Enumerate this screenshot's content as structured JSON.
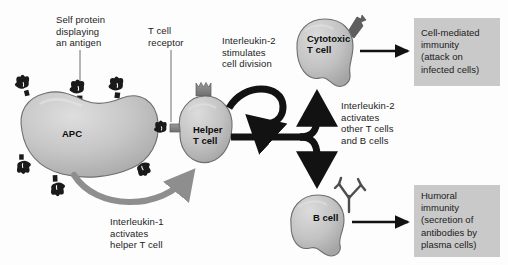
{
  "figure": {
    "background_color": "#fdfdfd"
  },
  "palette": {
    "cell_fill": "#c2c2c2",
    "cell_fill_light": "#d6d6d6",
    "cell_stroke": "#6e6e6e",
    "receptor_dark": "#1a1a1a",
    "receptor_gray": "#8a8a8a",
    "arrow_black": "#121212",
    "arrow_gray": "#8e8e8e",
    "box_fill": "#c9c9c9",
    "text_color": "#1c1c1c"
  },
  "cells": [
    {
      "id": "apc",
      "label": "APC",
      "label_x": 62,
      "label_y": 128
    },
    {
      "id": "helper-t-cell",
      "label": "Helper\nT cell",
      "label_x": 193,
      "label_y": 124
    },
    {
      "id": "cytotoxic-t-cell",
      "label": "Cytotoxic\nT cell",
      "label_x": 307,
      "label_y": 33
    },
    {
      "id": "b-cell",
      "label": "B cell",
      "label_x": 313,
      "label_y": 212
    }
  ],
  "annotations": [
    {
      "id": "self-protein",
      "text": "Self protein\ndisplaying\nan antigen",
      "x": 56,
      "y": 14,
      "leader": true
    },
    {
      "id": "t-cell-receptor",
      "text": "T cell\nreceptor",
      "x": 148,
      "y": 25,
      "leader": true
    },
    {
      "id": "interleukin-2-division",
      "text": "Interleukin-2\nstimulates\ncell division",
      "x": 222,
      "y": 35,
      "leader": false
    },
    {
      "id": "interleukin-2-activates",
      "text": "Interleukin-2\nactivates\nother T cells\nand B cells",
      "x": 341,
      "y": 100,
      "leader": false
    },
    {
      "id": "interleukin-1-activates",
      "text": "Interleukin-1\nactivates\nhelper T cell",
      "x": 110,
      "y": 216,
      "leader": false
    }
  ],
  "outcomes": [
    {
      "id": "cell-mediated-immunity",
      "text": "Cell-mediated\nimmunity\n(attack on\ninfected cells)",
      "box": {
        "x": 414,
        "y": 18,
        "w": 86,
        "h": 68
      },
      "text_x": 421,
      "text_y": 27
    },
    {
      "id": "humoral-immunity",
      "text": "Humoral\nimmunity\n(secretion of\nantibodies by\nplasma cells)",
      "box": {
        "x": 414,
        "y": 185,
        "w": 86,
        "h": 72
      },
      "text_x": 421,
      "text_y": 190
    }
  ],
  "flow_arrows": [
    {
      "id": "interleukin-1-arrow",
      "from": "apc",
      "to": "helper-t-cell",
      "color": "#8e8e8e",
      "style": "curved"
    },
    {
      "id": "interleukin-2-self-loop",
      "from": "helper-t-cell",
      "to": "helper-t-cell",
      "color": "#121212",
      "style": "loop"
    },
    {
      "id": "helper-to-cytotoxic-arrow",
      "from": "helper-t-cell",
      "to": "cytotoxic-t-cell",
      "color": "#121212",
      "style": "branch-up"
    },
    {
      "id": "helper-to-b-cell-arrow",
      "from": "helper-t-cell",
      "to": "b-cell",
      "color": "#121212",
      "style": "branch-down"
    },
    {
      "id": "cytotoxic-to-outcome-arrow",
      "from": "cytotoxic-t-cell",
      "to": "cell-mediated-immunity",
      "color": "#121212",
      "style": "straight"
    },
    {
      "id": "b-cell-to-outcome-arrow",
      "from": "b-cell",
      "to": "humoral-immunity",
      "color": "#121212",
      "style": "straight"
    }
  ]
}
